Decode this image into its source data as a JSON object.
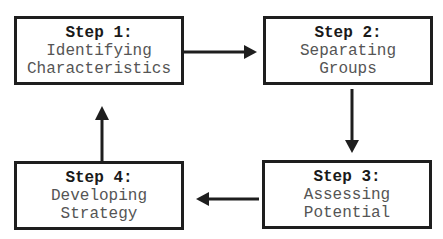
{
  "diagram": {
    "type": "cycle-flowchart",
    "steps": [
      {
        "title": "Step 1:",
        "lines": [
          "Identifying",
          "Characteristics"
        ]
      },
      {
        "title": "Step 2:",
        "lines": [
          "Separating",
          "Groups"
        ]
      },
      {
        "title": "Step 3:",
        "lines": [
          "Assessing",
          "Potential"
        ]
      },
      {
        "title": "Step 4:",
        "lines": [
          "Developing",
          "Strategy"
        ]
      }
    ],
    "flow": [
      "Step 1 -> Step 2",
      "Step 2 -> Step 3",
      "Step 3 -> Step 4",
      "Step 4 -> Step 1"
    ],
    "colors": {
      "border": "#1e1e1e",
      "title": "#1a1a1a",
      "text": "#555555",
      "background": "#ffffff"
    }
  }
}
